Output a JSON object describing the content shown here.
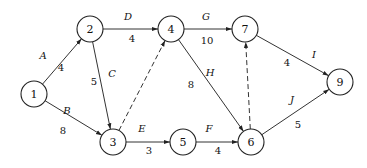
{
  "diagram": {
    "type": "activity-on-arrow network",
    "nodes": [
      {
        "id": "1",
        "label": "1",
        "x": 34,
        "y": 94
      },
      {
        "id": "2",
        "label": "2",
        "x": 90,
        "y": 29
      },
      {
        "id": "3",
        "label": "3",
        "x": 113,
        "y": 142
      },
      {
        "id": "4",
        "label": "4",
        "x": 171,
        "y": 29
      },
      {
        "id": "5",
        "label": "5",
        "x": 183,
        "y": 142
      },
      {
        "id": "6",
        "label": "6",
        "x": 251,
        "y": 142
      },
      {
        "id": "7",
        "label": "7",
        "x": 245,
        "y": 29
      },
      {
        "id": "9",
        "label": "9",
        "x": 340,
        "y": 82
      }
    ],
    "edges": [
      {
        "from": "1",
        "to": "2",
        "activity": "A",
        "duration": "4",
        "dummy": false
      },
      {
        "from": "1",
        "to": "3",
        "activity": "B",
        "duration": "8",
        "dummy": false
      },
      {
        "from": "2",
        "to": "3",
        "activity": "C",
        "duration": "5",
        "dummy": false
      },
      {
        "from": "2",
        "to": "4",
        "activity": "D",
        "duration": "4",
        "dummy": false
      },
      {
        "from": "3",
        "to": "5",
        "activity": "E",
        "duration": "3",
        "dummy": false
      },
      {
        "from": "5",
        "to": "6",
        "activity": "F",
        "duration": "4",
        "dummy": false
      },
      {
        "from": "4",
        "to": "7",
        "activity": "G",
        "duration": "10",
        "dummy": false
      },
      {
        "from": "4",
        "to": "6",
        "activity": "H",
        "duration": "8",
        "dummy": false
      },
      {
        "from": "7",
        "to": "9",
        "activity": "I",
        "duration": "4",
        "dummy": false
      },
      {
        "from": "6",
        "to": "9",
        "activity": "J",
        "duration": "5",
        "dummy": false
      },
      {
        "from": "3",
        "to": "4",
        "activity": "",
        "duration": "",
        "dummy": true
      },
      {
        "from": "6",
        "to": "7",
        "activity": "",
        "duration": "",
        "dummy": true
      }
    ],
    "labels": {
      "A": {
        "name": "A",
        "name_pos": [
          43,
          55
        ],
        "dur": "4",
        "dur_pos": [
          61,
          67
        ]
      },
      "B": {
        "name": "B",
        "name_pos": [
          67,
          110
        ],
        "dur": "8",
        "dur_pos": [
          63,
          130
        ]
      },
      "C": {
        "name": "C",
        "name_pos": [
          112,
          73
        ],
        "dur": "5",
        "dur_pos": [
          94,
          81
        ]
      },
      "D": {
        "name": "D",
        "name_pos": [
          128,
          16
        ],
        "dur": "4",
        "dur_pos": [
          132,
          38
        ]
      },
      "E": {
        "name": "E",
        "name_pos": [
          142,
          128
        ],
        "dur": "3",
        "dur_pos": [
          149,
          150
        ]
      },
      "F": {
        "name": "F",
        "name_pos": [
          209,
          128
        ],
        "dur": "4",
        "dur_pos": [
          218,
          150
        ]
      },
      "G": {
        "name": "G",
        "name_pos": [
          206,
          16
        ],
        "dur": "10",
        "dur_pos": [
          207,
          40
        ]
      },
      "H": {
        "name": "H",
        "name_pos": [
          210,
          72
        ],
        "dur": "8",
        "dur_pos": [
          191,
          84
        ]
      },
      "I": {
        "name": "I",
        "name_pos": [
          314,
          54
        ],
        "dur": "4",
        "dur_pos": [
          287,
          62
        ]
      },
      "J": {
        "name": "J",
        "name_pos": [
          292,
          99
        ],
        "dur": "5",
        "dur_pos": [
          298,
          124
        ]
      }
    }
  }
}
